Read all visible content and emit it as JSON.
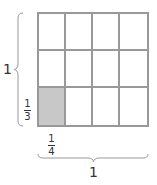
{
  "diagram": {
    "type": "area-model-grid",
    "columns": 4,
    "rows": 3,
    "shaded_cells": [
      {
        "row": 3,
        "col": 1
      }
    ],
    "colors": {
      "grid_line": "#999999",
      "shaded_fill": "#c8c8c8",
      "text": "#333333"
    },
    "left_brace_label": "1",
    "row_fraction": {
      "numerator": "1",
      "denominator": "3"
    },
    "column_fraction": {
      "numerator": "1",
      "denominator": "4"
    },
    "bottom_brace_label": "1"
  }
}
